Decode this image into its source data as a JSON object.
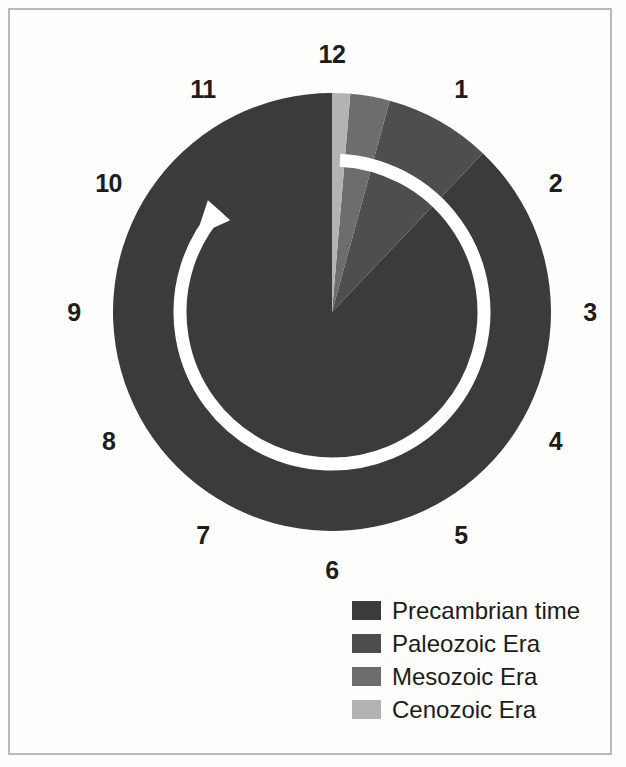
{
  "figure": {
    "background_color": "#fdfdfc",
    "frame_color": "#b9b9b7"
  },
  "clock": {
    "name": "clock-face",
    "hour_labels": [
      "12",
      "1",
      "2",
      "3",
      "4",
      "5",
      "6",
      "7",
      "8",
      "9",
      "10",
      "11"
    ],
    "center_x": 332,
    "center_y": 312,
    "radius": 219,
    "label_radius": 258,
    "arrow": {
      "name": "clockwise-direction-arrow",
      "color": "#ffffff",
      "ring_radius": 152,
      "stroke_width": 13,
      "start_hour": 12,
      "end_hour": 10.4,
      "direction": "clockwise"
    }
  },
  "chart_data": {
    "type": "pie",
    "xlabel": "",
    "ylabel": "",
    "legend_position": "bottom-right",
    "grid": false,
    "units": "clock hours (12 h = 4.6 billion years)",
    "start_angle_deg": 0,
    "direction": "counterclockwise-from-12",
    "categories": [
      "Precambrian time",
      "Paleozoic Era",
      "Mesozoic Era",
      "Cenozoic Era"
    ],
    "values": [
      10.55,
      0.94,
      0.35,
      0.16
    ],
    "percent": [
      87.9,
      7.8,
      2.9,
      1.4
    ],
    "colors": [
      "#3b3b3b",
      "#4e4e4e",
      "#6d6d6d",
      "#b3b3b3"
    ],
    "slices": [
      {
        "label": "Precambrian time",
        "value": 10.55,
        "percent": 87.9,
        "color": "#3b3b3b"
      },
      {
        "label": "Paleozoic Era",
        "value": 0.94,
        "percent": 7.8,
        "color": "#4e4e4e"
      },
      {
        "label": "Mesozoic Era",
        "value": 0.35,
        "percent": 2.9,
        "color": "#6d6d6d"
      },
      {
        "label": "Cenozoic Era",
        "value": 0.16,
        "percent": 1.4,
        "color": "#b3b3b3"
      }
    ]
  },
  "legend": {
    "name": "era-legend",
    "items": [
      {
        "label": "Precambrian time",
        "color": "#3b3b3b"
      },
      {
        "label": "Paleozoic Era",
        "color": "#4e4e4e"
      },
      {
        "label": "Mesozoic Era",
        "color": "#6d6d6d"
      },
      {
        "label": "Cenozoic Era",
        "color": "#b3b3b3"
      }
    ]
  }
}
